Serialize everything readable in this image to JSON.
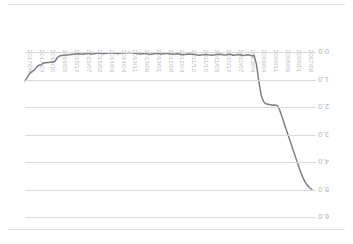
{
  "chart_data": {
    "type": "line",
    "title": "",
    "subtitle": "",
    "xlabel": "",
    "ylabel": "",
    "grid": true,
    "legend": "none",
    "axis_notes": "x axis runs newest-to-oldest left-to-right; y axis increases downward (inverted) with labels drawn rotated 180 degrees",
    "xlim": [
      "2017/08",
      "2007/08"
    ],
    "ylim": [
      0.0,
      6.0
    ],
    "ytick_labels": [
      "0.0",
      "1.0",
      "2.0",
      "3.0",
      "4.0",
      "5.0",
      "6.0"
    ],
    "ytick_values": [
      0.0,
      1.0,
      2.0,
      3.0,
      4.0,
      5.0,
      6.0
    ],
    "xtick_labels": [
      "2017/08",
      "2017/03",
      "2016/10",
      "2016/05",
      "2015/12",
      "2015/07",
      "2015/02",
      "2014/09",
      "2014/04",
      "2013/11",
      "2013/06",
      "2013/01",
      "2012/08",
      "2012/03",
      "2011/12",
      "2011/10",
      "2011/05",
      "2010/12",
      "2010/07",
      "2009/09",
      "2009/04",
      "2008/11",
      "2008/06",
      "2008/01",
      "2007/08"
    ],
    "series": [
      {
        "name": "series-1",
        "color": "#7f7f84",
        "values": [
          1.05,
          0.92,
          0.78,
          0.72,
          0.66,
          0.55,
          0.48,
          0.46,
          0.4,
          0.39,
          0.38,
          0.37,
          0.36,
          0.34,
          0.2,
          0.14,
          0.13,
          0.12,
          0.11,
          0.1,
          0.09,
          0.08,
          0.07,
          0.06,
          0.07,
          0.08,
          0.06,
          0.05,
          0.06,
          0.07,
          0.06,
          0.05,
          0.04,
          0.05,
          0.06,
          0.05,
          0.04,
          0.03,
          0.04,
          0.05,
          0.06,
          0.05,
          0.04,
          0.03,
          0.03,
          0.02,
          0.03,
          0.04,
          0.05,
          0.06,
          0.07,
          0.06,
          0.05,
          0.07,
          0.08,
          0.07,
          0.06,
          0.05,
          0.06,
          0.07,
          0.06,
          0.05,
          0.06,
          0.07,
          0.08,
          0.07,
          0.06,
          0.08,
          0.1,
          0.09,
          0.08,
          0.07,
          0.08,
          0.09,
          0.1,
          0.12,
          0.11,
          0.1,
          0.09,
          0.1,
          0.11,
          0.12,
          0.1,
          0.09,
          0.08,
          0.09,
          0.11,
          0.1,
          0.08,
          0.09,
          0.12,
          0.11,
          0.09,
          0.1,
          0.13,
          0.12,
          0.1,
          0.11,
          0.14,
          0.13,
          0.45,
          1.05,
          1.55,
          1.8,
          1.88,
          1.9,
          1.92,
          1.94,
          1.93,
          1.95,
          2.1,
          2.35,
          2.6,
          2.85,
          3.1,
          3.35,
          3.6,
          3.85,
          4.1,
          4.35,
          4.55,
          4.72,
          4.85,
          4.94,
          5.0
        ]
      }
    ]
  },
  "axes": {
    "y_unit": "",
    "x_unit": ""
  }
}
